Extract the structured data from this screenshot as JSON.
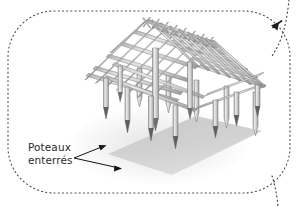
{
  "figure": {
    "type": "technical-illustration",
    "background_color": "#ffffff",
    "border": {
      "style": "dotted",
      "shape": "rounded-rectangle",
      "color": "#555555",
      "corner_radius": 46
    },
    "palette": {
      "pole_light": "#e2e2e2",
      "pole_mid": "#c4c4c4",
      "pole_dark": "#9a9a9a",
      "pole_outline": "#7d7d7d",
      "post_tip": "#5a5a5a",
      "ground_shadow": "#cfcfcf",
      "ground_shadow_soft": "#dedede",
      "label_color": "#2a2a2a",
      "leader_color": "#1a1a1a"
    }
  },
  "annotations": {
    "callout": {
      "label_line_1": "Poteaux",
      "label_line_2": "enterrés",
      "leader_count": 2,
      "leader_targets": [
        "upper-post-tip",
        "lower-post-tip"
      ]
    },
    "edge_pointers": [
      {
        "name": "top-right-pointer",
        "direction": "down-left",
        "style": "dotted-with-arrowhead"
      },
      {
        "name": "bottom-right-pointer",
        "direction": "down",
        "style": "dotted-branch"
      }
    ]
  },
  "structure": {
    "roof": "lattice grid of lashed poles forming a hipped roof",
    "ridge": "crossed pole ends projecting above the ridge line",
    "posts_visible": 11,
    "post_detail": "tapered sharpened lower ends, dark pointed tips"
  }
}
